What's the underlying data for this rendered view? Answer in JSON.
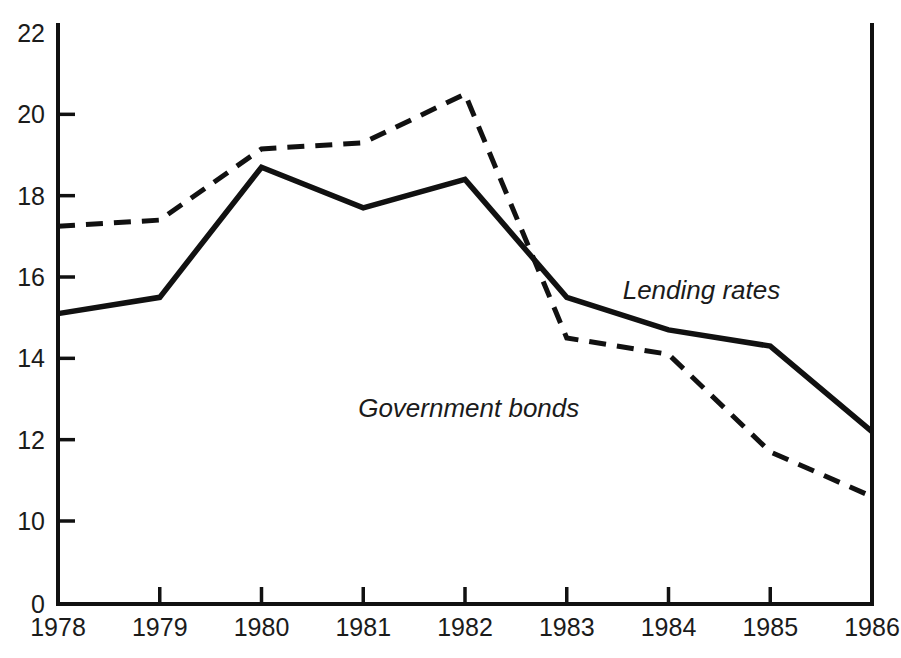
{
  "chart_data": {
    "type": "line",
    "title": "",
    "subtitle": "",
    "xlabel": "",
    "ylabel": "",
    "categories": [
      "1978",
      "1979",
      "1980",
      "1981",
      "1982",
      "1983",
      "1984",
      "1985",
      "1986"
    ],
    "x": [
      1978,
      1979,
      1980,
      1981,
      1982,
      1983,
      1984,
      1985,
      1986
    ],
    "series": [
      {
        "name": "Lending rates",
        "style": "solid",
        "values": [
          15.1,
          15.5,
          18.7,
          17.7,
          18.4,
          15.5,
          14.7,
          14.3,
          12.2
        ]
      },
      {
        "name": "Government bonds",
        "style": "dashed",
        "values": [
          17.25,
          17.4,
          19.15,
          19.3,
          20.5,
          14.5,
          14.1,
          11.7,
          10.6
        ]
      }
    ],
    "ylim": [
      0,
      22
    ],
    "y_ticks": [
      0,
      10,
      12,
      14,
      16,
      18,
      20,
      22
    ],
    "y_tick_labels": [
      "0",
      "10",
      "12",
      "14",
      "16",
      "18",
      "20",
      "22"
    ],
    "y_axis_break": true,
    "y_axis_break_note": "axis jumps from 0 to 10",
    "x_ticks": [
      1978,
      1979,
      1980,
      1981,
      1982,
      1983,
      1984,
      1985,
      1986
    ],
    "x_tick_labels": [
      "1978",
      "1979",
      "1980",
      "1981",
      "1982",
      "1983",
      "1984",
      "1985",
      "1986"
    ],
    "grid": false,
    "legend": "inline-annotations",
    "annotations": [
      {
        "text": "Lending rates",
        "x": 1983.55,
        "y": 15.45
      },
      {
        "text": "Government bonds",
        "x": 1980.95,
        "y": 12.55
      }
    ],
    "colors": {
      "line": "#111111",
      "text": "#1b1b1b",
      "background": "#ffffff"
    }
  },
  "geometry": {
    "plot_left": 58,
    "plot_right": 872,
    "plot_top": 25,
    "plot_bottom": 604,
    "value_top": 22,
    "value_top_y": 33,
    "value_ten_y": 521,
    "label_zero_y": 604
  }
}
